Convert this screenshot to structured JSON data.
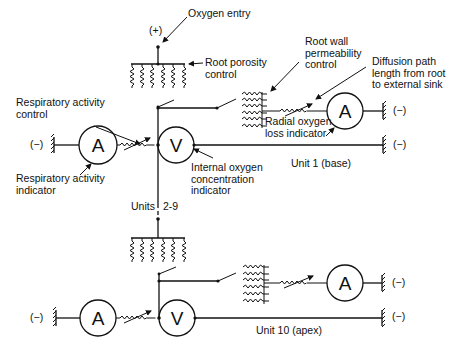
{
  "diagram": {
    "labels": {
      "oxygen_entry": "Oxygen entry",
      "plus": "(+)",
      "root_porosity": "Root porosity\ncontrol",
      "root_wall": "Root wall\npermeability\ncontrol",
      "diffusion_path": "Diffusion path\nlength from root\nto external sink",
      "respiratory_control": "Respiratory activity\ncontrol",
      "respiratory_indicator": "Respiratory activity\nindicator",
      "internal_oxygen": "Internal oxygen\nconcentration\nindicator",
      "radial_loss": "Radial oxygen\nloss indicator",
      "unit1": "Unit 1 (base)",
      "units_mid": "Units",
      "units_range": "2-9",
      "unit10": "Unit 10 (apex)",
      "minus": "(−)"
    },
    "meters": {
      "ammeter": "A",
      "voltmeter": "V"
    },
    "units": [
      {
        "name": "Unit 1 (base)",
        "components": [
          "porosity resistor bank",
          "switch",
          "root wall resistor bank",
          "variable resistor",
          "ammeter A",
          "ground (−)",
          "respiratory ammeter A",
          "respiratory variable resistor",
          "voltmeter V",
          "ground (−)"
        ]
      },
      {
        "name": "Units 2-9",
        "components": [
          "omitted (dashed)"
        ]
      },
      {
        "name": "Unit 10 (apex)",
        "components": [
          "porosity resistor bank",
          "switch",
          "root wall resistor bank",
          "variable resistor",
          "ammeter A",
          "ground (−)",
          "respiratory ammeter A",
          "respiratory variable resistor",
          "voltmeter V",
          "ground (−)"
        ]
      }
    ],
    "colors": {
      "ink": "#111111",
      "background": "#ffffff"
    }
  }
}
